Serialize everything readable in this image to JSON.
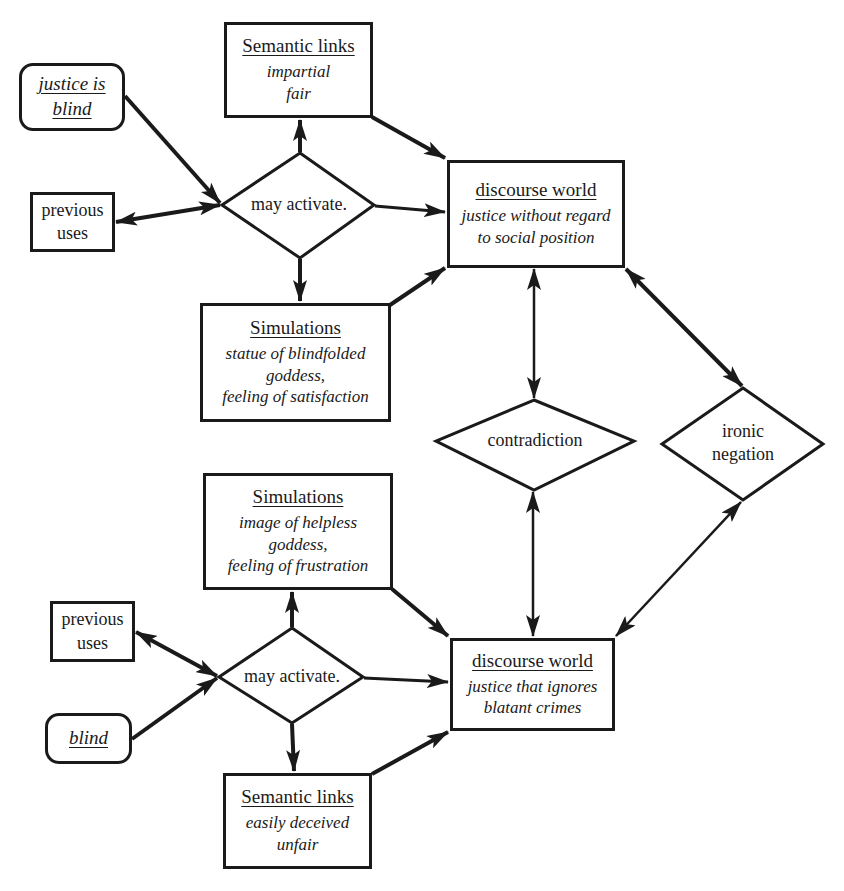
{
  "diagram": {
    "top_section": {
      "input_phrase": {
        "line1": "justice is",
        "line2": "blind"
      },
      "previous_uses": {
        "line1": "previous",
        "line2": "uses"
      },
      "decision": {
        "label": "may activate."
      },
      "semantic_links": {
        "title": "Semantic links",
        "items": [
          "impartial",
          "fair"
        ]
      },
      "simulations": {
        "title": "Simulations",
        "items": [
          "statue of blindfolded",
          "goddess,",
          "feeling of satisfaction"
        ]
      },
      "discourse_world": {
        "title": "discourse world",
        "lines": [
          "justice without regard",
          "to social position"
        ]
      }
    },
    "middle": {
      "contradiction": {
        "label": "contradiction"
      },
      "ironic_negation": {
        "line1": "ironic",
        "line2": "negation"
      }
    },
    "bottom_section": {
      "input_phrase": {
        "label": "blind"
      },
      "previous_uses": {
        "line1": "previous",
        "line2": "uses"
      },
      "decision": {
        "label": "may activate."
      },
      "simulations": {
        "title": "Simulations",
        "items": [
          "image of helpless",
          "goddess,",
          "feeling of frustration"
        ]
      },
      "semantic_links": {
        "title": "Semantic links",
        "items": [
          "easily deceived",
          "unfair"
        ]
      },
      "discourse_world": {
        "title": "discourse world",
        "lines": [
          "justice that ignores",
          "blatant crimes"
        ]
      }
    },
    "colors": {
      "stroke": "#1a1a1a",
      "background": "#ffffff"
    }
  }
}
